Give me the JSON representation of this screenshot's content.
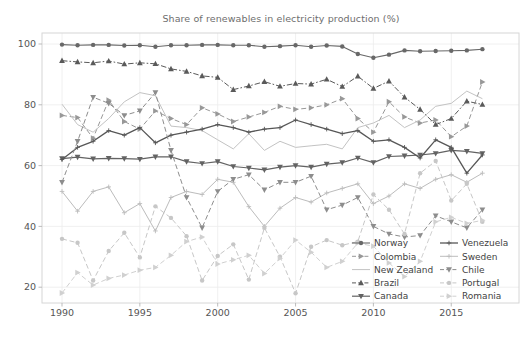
{
  "title": "Share of renewables in electricity production (%)",
  "chart_data": {
    "type": "line",
    "title": "Share of renewables in electricity production (%)",
    "xlabel": "",
    "ylabel": "",
    "x": [
      1990,
      1991,
      1992,
      1993,
      1994,
      1995,
      1996,
      1997,
      1998,
      1999,
      2000,
      2001,
      2002,
      2003,
      2004,
      2005,
      2006,
      2007,
      2008,
      2009,
      2010,
      2011,
      2012,
      2013,
      2014,
      2015,
      2016,
      2017
    ],
    "xticks": [
      1990,
      1995,
      2000,
      2005,
      2010,
      2015
    ],
    "yticks": [
      20,
      40,
      60,
      80,
      100
    ],
    "xlim": [
      1988.7,
      2019.3
    ],
    "ylim": [
      14.5,
      103.5
    ],
    "grid": true,
    "legend_position": "lower right, two columns, no frame",
    "legend_columns": [
      [
        "Norway",
        "Colombia",
        "New Zealand",
        "Brazil",
        "Canada"
      ],
      [
        "Venezuela",
        "Sweden",
        "Chile",
        "Portugal",
        "Romania"
      ]
    ],
    "series": [
      {
        "name": "Norway",
        "color": "#686868",
        "marker": "circle",
        "dash": "solid",
        "width": 1.1,
        "values": [
          99.8,
          99.6,
          99.7,
          99.7,
          99.5,
          99.6,
          99.1,
          99.6,
          99.6,
          99.7,
          99.7,
          99.6,
          99.6,
          99.1,
          99.3,
          99.6,
          99.1,
          99.5,
          99.2,
          96.7,
          95.5,
          96.5,
          97.9,
          97.6,
          97.7,
          97.8,
          97.9,
          98.3
        ]
      },
      {
        "name": "Colombia",
        "color": "#989898",
        "marker": "triangle-right",
        "dash": "dashed",
        "width": 1.0,
        "values": [
          76.5,
          75.8,
          69.0,
          81.5,
          74.5,
          72.0,
          78.0,
          75.5,
          73.5,
          79.0,
          77.0,
          74.5,
          76.0,
          77.5,
          79.5,
          78.5,
          79.0,
          80.0,
          82.0,
          75.5,
          71.0,
          81.0,
          76.0,
          74.0,
          75.0,
          69.5,
          73.0,
          87.5
        ]
      },
      {
        "name": "New Zealand",
        "color": "#c3c3c3",
        "marker": "none",
        "dash": "solid",
        "width": 1.0,
        "values": [
          80.2,
          73.5,
          71.0,
          75.5,
          81.0,
          84.0,
          83.0,
          73.0,
          72.5,
          71.5,
          68.5,
          65.5,
          70.5,
          65.0,
          68.0,
          66.0,
          66.5,
          67.0,
          65.5,
          72.5,
          74.0,
          76.5,
          72.5,
          75.0,
          79.5,
          80.5,
          84.5,
          82.0
        ]
      },
      {
        "name": "Brazil",
        "color": "#5a5a5a",
        "marker": "triangle-up",
        "dash": "dashdot",
        "width": 1.0,
        "values": [
          94.5,
          94.1,
          93.8,
          94.4,
          93.4,
          93.8,
          93.5,
          91.8,
          91.0,
          89.5,
          89.0,
          85.0,
          86.2,
          87.6,
          86.1,
          87.0,
          86.8,
          88.4,
          86.0,
          89.4,
          85.4,
          87.8,
          82.5,
          78.5,
          73.5,
          75.5,
          81.2,
          80.1
        ]
      },
      {
        "name": "Canada",
        "color": "#636363",
        "marker": "triangle-down",
        "dash": "solid",
        "width": 1.2,
        "values": [
          62.3,
          62.8,
          62.2,
          62.4,
          62.3,
          62.1,
          62.9,
          62.9,
          61.3,
          60.7,
          61.3,
          59.7,
          59.2,
          58.6,
          59.5,
          60.0,
          59.5,
          60.5,
          61.0,
          62.5,
          61.0,
          63.0,
          63.2,
          63.5,
          64.0,
          65.0,
          64.7,
          64.0
        ]
      },
      {
        "name": "Venezuela",
        "color": "#575757",
        "marker": "plus",
        "dash": "solid",
        "width": 1.3,
        "values": [
          62.0,
          66.0,
          68.0,
          71.5,
          70.0,
          72.5,
          67.5,
          70.0,
          71.0,
          72.0,
          73.5,
          72.5,
          71.0,
          72.0,
          72.5,
          75.0,
          73.5,
          72.0,
          70.5,
          71.5,
          68.0,
          68.5,
          66.0,
          62.5,
          68.5,
          66.0,
          57.5,
          63.5
        ]
      },
      {
        "name": "Sweden",
        "color": "#bcbcbc",
        "marker": "plus",
        "dash": "solid",
        "width": 1.0,
        "values": [
          51.5,
          45.0,
          51.5,
          53.0,
          44.5,
          47.5,
          38.5,
          49.5,
          51.5,
          50.5,
          55.5,
          54.5,
          46.5,
          40.0,
          46.0,
          49.5,
          48.0,
          51.0,
          52.5,
          54.0,
          47.5,
          50.0,
          54.0,
          52.5,
          55.5,
          57.0,
          54.5,
          57.5
        ]
      },
      {
        "name": "Chile",
        "color": "#8d8d8d",
        "marker": "triangle-down",
        "dash": "dashed",
        "width": 1.0,
        "values": [
          54.5,
          68.0,
          82.5,
          80.5,
          76.5,
          78.0,
          84.0,
          65.0,
          49.5,
          39.5,
          51.5,
          55.5,
          57.0,
          52.0,
          54.5,
          54.5,
          56.5,
          45.5,
          47.0,
          49.5,
          40.0,
          37.5,
          36.5,
          37.0,
          43.5,
          41.5,
          39.5,
          45.5
        ]
      },
      {
        "name": "Portugal",
        "color": "#c7c7c7",
        "marker": "circle",
        "dash": "dashed",
        "width": 1.0,
        "values": [
          35.9,
          34.6,
          22.2,
          31.9,
          37.9,
          29.8,
          46.6,
          42.8,
          36.8,
          22.2,
          30.3,
          34.1,
          22.5,
          39.5,
          30.0,
          18.0,
          33.3,
          35.5,
          33.8,
          35.0,
          50.5,
          45.5,
          37.5,
          57.5,
          61.5,
          48.5,
          54.0,
          41.5
        ]
      },
      {
        "name": "Romania",
        "color": "#d0d0d0",
        "marker": "triangle-right",
        "dash": "dashed",
        "width": 1.0,
        "values": [
          18.1,
          24.8,
          20.7,
          22.9,
          24.0,
          25.6,
          26.5,
          30.5,
          35.0,
          36.5,
          27.6,
          29.0,
          30.5,
          24.5,
          29.5,
          35.5,
          31.5,
          26.5,
          28.5,
          34.5,
          33.5,
          28.0,
          23.5,
          28.5,
          41.5,
          43.0,
          41.0,
          42.0
        ]
      }
    ],
    "style": {
      "background": "#ffffff",
      "gridline_color": "#ececec",
      "spine_color": "#d6d6d6",
      "tick_label_color": "#555555",
      "legend_text_color": "#3f3f3f",
      "title_color": "#6e6e6e"
    }
  }
}
